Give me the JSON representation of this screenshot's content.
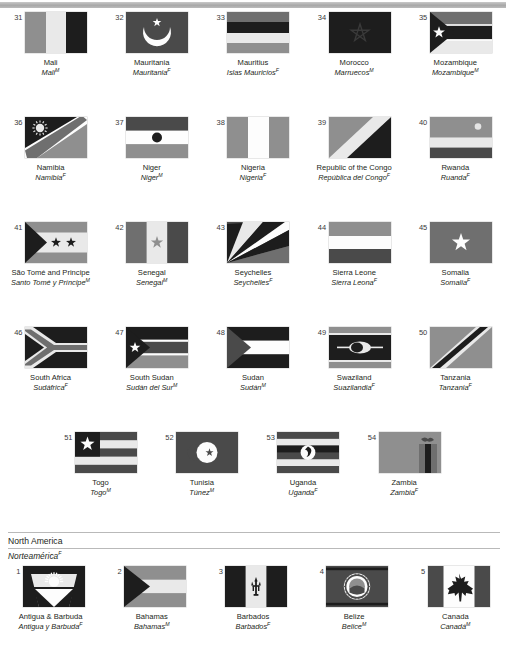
{
  "page": {
    "top_rule": true,
    "background": "#ffffff",
    "text_color": "#231f20"
  },
  "section_header": {
    "name_en": "North America",
    "name_es": "Norteamérica",
    "gender": "F"
  },
  "rows": [
    {
      "items": [
        {
          "num": "31",
          "en": "Mali",
          "es": "Mali",
          "gender": "M",
          "flag": "mali"
        },
        {
          "num": "32",
          "en": "Mauritania",
          "es": "Mauritania",
          "gender": "F",
          "flag": "mauritania"
        },
        {
          "num": "33",
          "en": "Mauritius",
          "es": "Islas Mauricios",
          "gender": "F",
          "flag": "mauritius"
        },
        {
          "num": "34",
          "en": "Morocco",
          "es": "Marruecos",
          "gender": "M",
          "flag": "morocco"
        },
        {
          "num": "35",
          "en": "Mozambique",
          "es": "Mozambique",
          "gender": "M",
          "flag": "mozambique"
        }
      ]
    },
    {
      "items": [
        {
          "num": "36",
          "en": "Namibia",
          "es": "Namibia",
          "gender": "F",
          "flag": "namibia"
        },
        {
          "num": "37",
          "en": "Niger",
          "es": "Niger",
          "gender": "M",
          "flag": "niger"
        },
        {
          "num": "38",
          "en": "Nigeria",
          "es": "Nigeria",
          "gender": "F",
          "flag": "nigeria"
        },
        {
          "num": "39",
          "en": "Republic of the Congo",
          "es": "República del Congo",
          "gender": "F",
          "flag": "congo"
        },
        {
          "num": "40",
          "en": "Rwanda",
          "es": "Ruanda",
          "gender": "F",
          "flag": "rwanda"
        }
      ]
    },
    {
      "items": [
        {
          "num": "41",
          "en": "São Tomé and Principe",
          "es": "Santo Tomé y Príncipe",
          "gender": "M",
          "flag": "saotome"
        },
        {
          "num": "42",
          "en": "Senegal",
          "es": "Senegal",
          "gender": "M",
          "flag": "senegal"
        },
        {
          "num": "43",
          "en": "Seychelles",
          "es": "Seychelles",
          "gender": "F",
          "flag": "seychelles"
        },
        {
          "num": "44",
          "en": "Sierra Leone",
          "es": "Sierra Leona",
          "gender": "F",
          "flag": "sierraleone"
        },
        {
          "num": "45",
          "en": "Somalia",
          "es": "Somalia",
          "gender": "F",
          "flag": "somalia"
        }
      ]
    },
    {
      "items": [
        {
          "num": "46",
          "en": "South Africa",
          "es": "Sudáfrica",
          "gender": "F",
          "flag": "southafrica"
        },
        {
          "num": "47",
          "en": "South Sudan",
          "es": "Sudán del Sur",
          "gender": "M",
          "flag": "southsudan"
        },
        {
          "num": "48",
          "en": "Sudan",
          "es": "Sudán",
          "gender": "M",
          "flag": "sudan"
        },
        {
          "num": "49",
          "en": "Swaziland",
          "es": "Suazilandia",
          "gender": "F",
          "flag": "swaziland"
        },
        {
          "num": "50",
          "en": "Tanzania",
          "es": "Tanzania",
          "gender": "F",
          "flag": "tanzania"
        }
      ]
    },
    {
      "items": [
        {
          "num": "51",
          "en": "Togo",
          "es": "Togo",
          "gender": "M",
          "flag": "togo"
        },
        {
          "num": "52",
          "en": "Tunisia",
          "es": "Túnez",
          "gender": "M",
          "flag": "tunisia"
        },
        {
          "num": "53",
          "en": "Uganda",
          "es": "Uganda",
          "gender": "F",
          "flag": "uganda"
        },
        {
          "num": "54",
          "en": "Zambia",
          "es": "Zambia",
          "gender": "F",
          "flag": "zambia"
        }
      ]
    },
    {
      "items": [
        {
          "num": "1",
          "en": "Antigua & Barbuda",
          "es": "Antigua y Barbuda",
          "gender": "F",
          "flag": "antigua"
        },
        {
          "num": "2",
          "en": "Bahamas",
          "es": "Bahamas",
          "gender": "M",
          "flag": "bahamas"
        },
        {
          "num": "3",
          "en": "Barbados",
          "es": "Barbados",
          "gender": "F",
          "flag": "barbados"
        },
        {
          "num": "4",
          "en": "Belize",
          "es": "Belice",
          "gender": "M",
          "flag": "belize"
        },
        {
          "num": "5",
          "en": "Canada",
          "es": "Canadá",
          "gender": "M",
          "flag": "canada"
        }
      ]
    }
  ],
  "palette": {
    "light": "#e9e9e9",
    "white": "#fdfdfd",
    "midlight": "#b6b6b6",
    "mid": "#8f8f8f",
    "middark": "#6f6f6f",
    "dark": "#4a4a4a",
    "black": "#1d1d1d",
    "rule": "#b9b9b9"
  }
}
